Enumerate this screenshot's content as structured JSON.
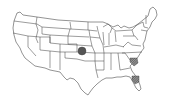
{
  "map": {
    "type": "choropleth-outline",
    "region": "United States (contiguous)",
    "background": "#ffffff",
    "stroke_color": "#3a3a3a",
    "markers": [
      {
        "id": "kansas",
        "kind": "filled-circle",
        "state": "Kansas",
        "x": 82,
        "y": 51,
        "r": 4,
        "color": "#555555"
      },
      {
        "id": "south-carolina",
        "kind": "hatched-area",
        "state": "South Carolina",
        "x": 134,
        "y": 61,
        "r": 4,
        "color": "#6a6a6a"
      },
      {
        "id": "florida",
        "kind": "hatched-area",
        "state": "Florida",
        "x": 136,
        "y": 79,
        "r": 4,
        "color": "#6a6a6a"
      }
    ]
  }
}
